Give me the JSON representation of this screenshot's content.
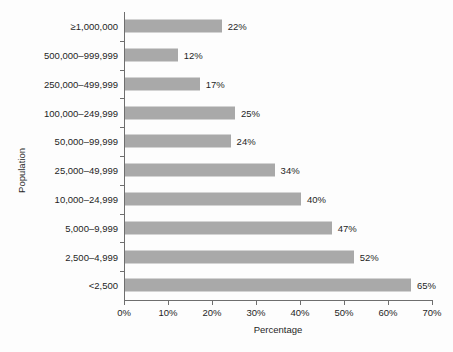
{
  "chart_data": {
    "type": "bar",
    "orientation": "horizontal",
    "title": "",
    "xlabel": "Percentage",
    "ylabel": "Population",
    "xlim": [
      0,
      70
    ],
    "grid": false,
    "legend": null,
    "bar_color": "#a9a9a9",
    "axis_color": "#6e6e6e",
    "xticks": [
      "0%",
      "10%",
      "20%",
      "30%",
      "40%",
      "50%",
      "60%",
      "70%"
    ],
    "xtick_values": [
      0,
      10,
      20,
      30,
      40,
      50,
      60,
      70
    ],
    "categories": [
      "≥1,000,000",
      "500,000–999,999",
      "250,000–499,999",
      "100,000–249,999",
      "50,000–99,999",
      "25,000–49,999",
      "10,000–24,999",
      "5,000–9,999",
      "2,500–4,999",
      "<2,500"
    ],
    "values": [
      22,
      12,
      17,
      25,
      24,
      34,
      40,
      47,
      52,
      65
    ],
    "data_labels": [
      "22%",
      "12%",
      "17%",
      "25%",
      "24%",
      "34%",
      "40%",
      "47%",
      "52%",
      "65%"
    ]
  }
}
